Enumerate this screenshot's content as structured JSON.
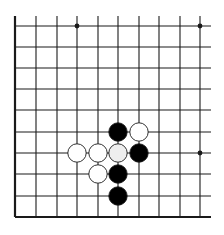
{
  "diagram": {
    "type": "go-board-fragment",
    "colors": {
      "background": "#ffffff",
      "line": "#1a1a1a",
      "black_stone": "#000000",
      "white_stone": "#ffffff",
      "white_stone_shaded": "#eeeeee",
      "stone_outline": "#1a1a1a"
    },
    "grid": {
      "columns_x": [
        15,
        36,
        57,
        77,
        98,
        118,
        139,
        159,
        180,
        200
      ],
      "rows_y": [
        26,
        47,
        68,
        89,
        110,
        132,
        153,
        174,
        196,
        217
      ],
      "left_edge_x": 15,
      "bottom_edge_y": 217,
      "top_extent_y": 16,
      "right_extent_x": 211
    },
    "star_points": [
      {
        "col": 3,
        "row": 0
      },
      {
        "col": 9,
        "row": 0
      },
      {
        "col": 9,
        "row": 6
      }
    ],
    "stones": [
      {
        "color": "black",
        "col": 5,
        "row": 5
      },
      {
        "color": "white",
        "col": 6,
        "row": 5
      },
      {
        "color": "white",
        "col": 3,
        "row": 6
      },
      {
        "color": "white",
        "col": 4,
        "row": 6
      },
      {
        "color": "white-shaded",
        "col": 5,
        "row": 6
      },
      {
        "color": "black",
        "col": 6,
        "row": 6
      },
      {
        "color": "white",
        "col": 4,
        "row": 7
      },
      {
        "color": "black",
        "col": 5,
        "row": 7
      },
      {
        "color": "black",
        "col": 5,
        "row": 8
      }
    ]
  }
}
